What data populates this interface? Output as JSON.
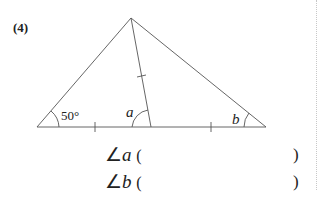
{
  "problem": {
    "number": "(4)",
    "given_angle": "50°",
    "angle_a_label": "a",
    "angle_b_label": "b"
  },
  "answers": [
    {
      "symbol": "∠",
      "var": "a",
      "open": "(",
      "value": "",
      "close": ")"
    },
    {
      "symbol": "∠",
      "var": "b",
      "open": "(",
      "value": "",
      "close": ")"
    }
  ],
  "colors": {
    "line": "#555555",
    "text": "#222222",
    "divider": "#c8c8c8"
  }
}
